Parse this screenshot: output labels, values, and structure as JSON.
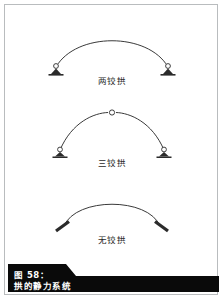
{
  "page": {
    "background_color": "#ffffff",
    "border_color": "#b9bcbe",
    "ink_color": "#3a3a3a"
  },
  "caption": {
    "number": "图 58：",
    "title": "拱的静力系统",
    "background_color": "#0a0a0a",
    "text_color": "#ffffff"
  },
  "figures": [
    {
      "id": "two-hinged-arch",
      "label": "两铰拱",
      "support_left": "pin-support",
      "support_right": "pin-support",
      "crown_hinge": false
    },
    {
      "id": "three-hinged-arch",
      "label": "三铰拱",
      "support_left": "pin-support",
      "support_right": "pin-support",
      "crown_hinge": true
    },
    {
      "id": "hingeless-arch",
      "label": "无铰拱",
      "support_left": "fixed-support",
      "support_right": "fixed-support",
      "crown_hinge": false
    }
  ]
}
